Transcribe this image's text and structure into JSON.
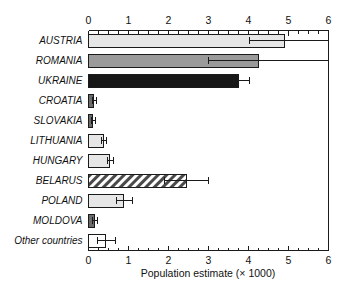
{
  "chart_data": {
    "type": "bar",
    "orientation": "horizontal",
    "title": "",
    "xlabel": "Population estimate (× 1000)",
    "ylabel": "",
    "xlim": [
      0,
      6
    ],
    "xticks": [
      0,
      1,
      2,
      3,
      4,
      5,
      6
    ],
    "xticklabels": [
      "0",
      "1",
      "2",
      "3",
      "4",
      "5",
      "6"
    ],
    "minor_tick_interval": 0.25,
    "grid": false,
    "legend": null,
    "axes_shown": [
      "top",
      "bottom"
    ],
    "categories": [
      "AUSTRIA",
      "ROMANIA",
      "UKRAINE",
      "CROATIA",
      "SLOVAKIA",
      "LITHUANIA",
      "HUNGARY",
      "BELARUS",
      "POLAND",
      "MOLDOVA",
      "Other countries"
    ],
    "values": [
      4.9,
      4.25,
      3.75,
      0.13,
      0.1,
      0.37,
      0.53,
      2.45,
      0.88,
      0.15,
      0.42
    ],
    "error_low": [
      4.02,
      3.0,
      3.62,
      0.1,
      0.08,
      0.33,
      0.47,
      1.9,
      0.7,
      0.1,
      0.22
    ],
    "error_high": [
      6.05,
      6.05,
      4.03,
      0.2,
      0.17,
      0.45,
      0.62,
      3.0,
      1.1,
      0.22,
      0.67
    ],
    "bar_fills": [
      "light-gray",
      "medium-gray",
      "black",
      "dark-gray",
      "dark-gray",
      "light-gray",
      "light-gray",
      "hatched-diagonal",
      "light-gray",
      "dark-gray",
      "white"
    ],
    "colors": {
      "light-gray": "#e6e6e6",
      "medium-gray": "#9a9a9a",
      "dark-gray": "#6b6b6b",
      "black": "#171717",
      "white": "#ffffff",
      "hatched-diagonal": "#ffffff",
      "edge": "#1a1a1a",
      "axis": "#1a1a1a",
      "error_bar": "#1a1a1a",
      "background": "#ffffff"
    }
  }
}
